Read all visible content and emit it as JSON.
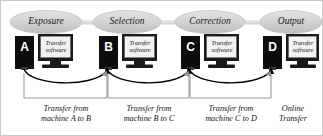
{
  "diagram": {
    "colors": {
      "ellipse_fill": "#d4d4d4",
      "ellipse_edge": "#bdbdbd",
      "connector": "#dedede",
      "tower": "#0d0d0d",
      "monitor_body": "#1a1a1a",
      "screen": "#f2f2f2",
      "arrow": "#000000",
      "bracket": "#9a9a9a",
      "border": "#c9c9c9",
      "text": "#141414",
      "letter": "#ffffff"
    },
    "stages": [
      {
        "label": "Exposure"
      },
      {
        "label": "Selection"
      },
      {
        "label": "Correction"
      },
      {
        "label": "Output"
      }
    ],
    "machines": [
      {
        "letter": "A",
        "screen_line1": "Transfer",
        "screen_line2": "software"
      },
      {
        "letter": "B",
        "screen_line1": "Transfer",
        "screen_line2": "software"
      },
      {
        "letter": "C",
        "screen_line1": "Transfer",
        "screen_line2": "software"
      },
      {
        "letter": "D",
        "screen_line1": "Transfer",
        "screen_line2": "software"
      }
    ],
    "transfers": [
      {
        "from": "A",
        "to": "B",
        "caption": "Transfer from\nmachine A to B",
        "bracketed": true
      },
      {
        "from": "B",
        "to": "C",
        "caption": "Transfer from\nmachine B to C",
        "bracketed": true
      },
      {
        "from": "C",
        "to": "D",
        "caption": "Transfer from\nmachine C to D",
        "bracketed": true
      },
      {
        "from": "D",
        "to": "",
        "caption": "Online\nTransfer",
        "bracketed": false
      }
    ]
  }
}
